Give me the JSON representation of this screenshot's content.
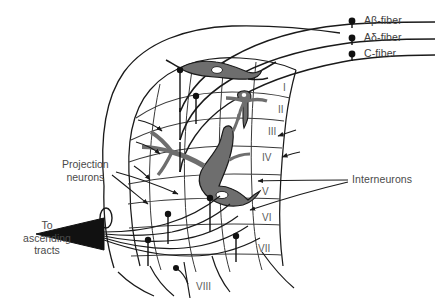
{
  "figure": {
    "background_color": "#ffffff",
    "line_color": "#1a1a1a",
    "neuron_fill_color": "#6e6e6e",
    "text_color": "#4a4a4a"
  },
  "fiber_labels": [
    {
      "id": "a-beta",
      "text": "Aβ-fiber",
      "x": 364,
      "y": 14
    },
    {
      "id": "a-delta",
      "text": "Aδ-fiber",
      "x": 364,
      "y": 31
    },
    {
      "id": "c-fiber",
      "text": "C-fiber",
      "x": 364,
      "y": 47
    }
  ],
  "laminae": [
    {
      "numeral": "I",
      "x": 283,
      "y": 82
    },
    {
      "numeral": "II",
      "x": 278,
      "y": 104
    },
    {
      "numeral": "III",
      "x": 268,
      "y": 126
    },
    {
      "numeral": "IV",
      "x": 262,
      "y": 152
    },
    {
      "numeral": "V",
      "x": 262,
      "y": 186
    },
    {
      "numeral": "VI",
      "x": 262,
      "y": 212
    },
    {
      "numeral": "VII",
      "x": 258,
      "y": 243
    },
    {
      "numeral": "VIII",
      "x": 196,
      "y": 281
    }
  ],
  "annotations": {
    "projection_neurons": {
      "line1": "Projection",
      "line2": "neurons",
      "x": 62,
      "y": 158
    },
    "ascending_tracts": {
      "line1": "To",
      "line2": "ascending",
      "line3": "tracts",
      "x": 8,
      "y": 219
    },
    "interneurons": {
      "text": "Interneurons",
      "x": 352,
      "y": 176
    }
  }
}
